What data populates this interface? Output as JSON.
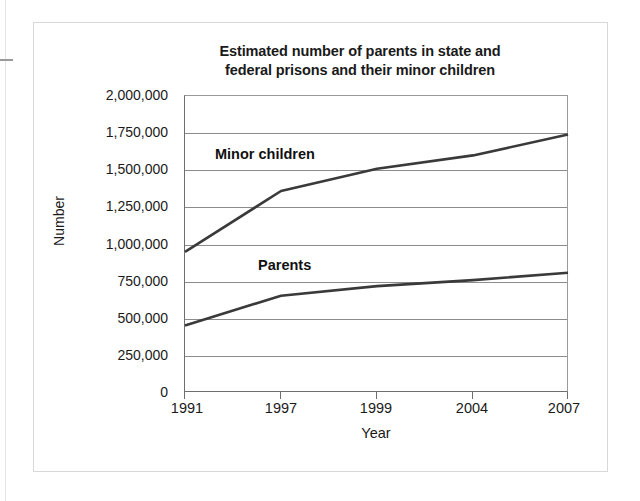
{
  "figure": {
    "title_line1": "Estimated number of parents in state and",
    "title_line2": "federal prisons and their minor children"
  },
  "axes": {
    "ylabel": "Number",
    "xlabel": "Year",
    "ytick_labels": [
      "2,000,000",
      "1,750,000",
      "1,500,000",
      "1,250,000",
      "1,000,000",
      "750,000",
      "500,000",
      "250,000",
      "0"
    ],
    "xtick_labels": [
      "1991",
      "1997",
      "1999",
      "2004",
      "2007"
    ]
  },
  "series_labels": {
    "children": "Minor children",
    "parents": "Parents"
  },
  "colors": {
    "line": "#3a3a3a",
    "grid": "#8c8c8c",
    "axis": "#6e6e6e",
    "frame": "#d8d8d8",
    "text": "#1a1a1a",
    "background": "#ffffff"
  },
  "chart_data": {
    "type": "line",
    "title": "Estimated number of parents in state and federal prisons and their minor children",
    "xlabel": "Year",
    "ylabel": "Number",
    "categories": [
      "1991",
      "1997",
      "1999",
      "2004",
      "2007"
    ],
    "ylim": [
      0,
      2000000
    ],
    "ytick_values": [
      0,
      250000,
      500000,
      750000,
      1000000,
      1250000,
      1500000,
      1750000,
      2000000
    ],
    "grid": true,
    "legend": "inline-labels",
    "series": [
      {
        "name": "Minor children",
        "values": [
          950000,
          1360000,
          1510000,
          1600000,
          1740000
        ]
      },
      {
        "name": "Parents",
        "values": [
          455000,
          655000,
          720000,
          760000,
          810000
        ]
      }
    ]
  }
}
